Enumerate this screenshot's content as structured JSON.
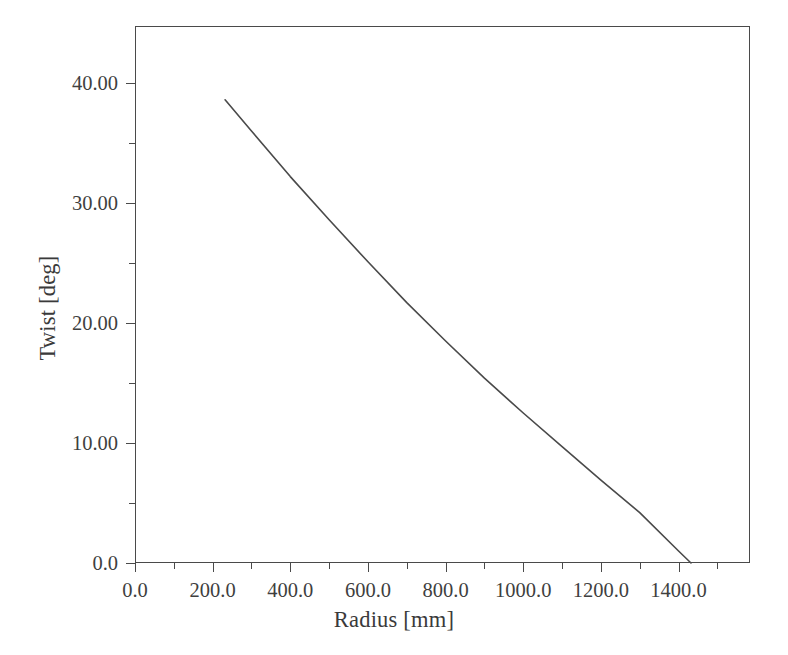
{
  "chart_data": {
    "type": "line",
    "title": "",
    "subtitle": "",
    "xlabel": "Radius [mm]",
    "ylabel": "Twist [deg]",
    "xlim": [
      0.0,
      1584.0
    ],
    "ylim": [
      0.0,
      44.75
    ],
    "grid": false,
    "legend": null,
    "legend_position": "none",
    "xticks": [
      0.0,
      200.0,
      400.0,
      600.0,
      800.0,
      1000.0,
      1200.0,
      1400.0
    ],
    "xtick_labels": [
      "0.0",
      "200.0",
      "400.0",
      "600.0",
      "800.0",
      "1000.0",
      "1200.0",
      "1400.0"
    ],
    "xminor_ticks": [
      100.0,
      300.0,
      500.0,
      700.0,
      900.0,
      1100.0,
      1300.0,
      1500.0
    ],
    "yticks": [
      0.0,
      10.0,
      20.0,
      30.0,
      40.0
    ],
    "ytick_labels": [
      "0.0",
      "10.00",
      "20.00",
      "30.00",
      "40.00"
    ],
    "yminor_ticks": [
      5.0,
      15.0,
      25.0,
      35.0
    ],
    "series": [
      {
        "name": "Twist distribution",
        "color": "#4a4a4a",
        "line_width": 1.6,
        "x": [
          232,
          300,
          400,
          500,
          600,
          700,
          800,
          900,
          1000,
          1100,
          1200,
          1300,
          1400,
          1432
        ],
        "y": [
          38.6,
          36.0,
          32.2,
          28.6,
          25.1,
          21.7,
          18.5,
          15.4,
          12.5,
          9.7,
          6.9,
          4.2,
          1.0,
          0.0
        ]
      }
    ]
  }
}
